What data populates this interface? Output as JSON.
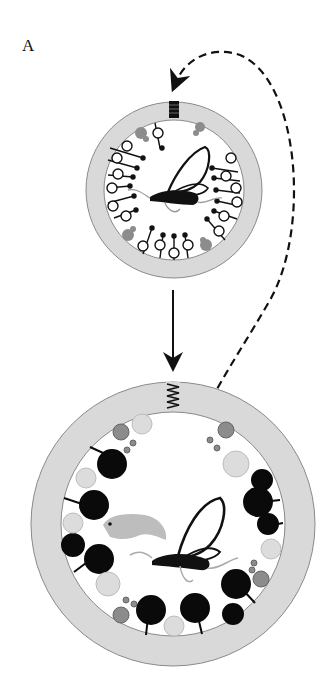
{
  "figure": {
    "panel_label": "A",
    "colors": {
      "background": "#ffffff",
      "ring": "#d9d9d9",
      "ring_stroke": "#8a8a8a",
      "black": "#0a0a0a",
      "dark_gray": "#8c8c8c",
      "light_gray": "#dcdcdc",
      "open": "#ffffff"
    },
    "top_cell": {
      "cx": 174,
      "cy": 190,
      "r_outer": 88,
      "r_inner": 70,
      "receptor": "closed-spring"
    },
    "bottom_cell": {
      "cx": 173,
      "cy": 524,
      "r_outer": 142,
      "r_inner": 112,
      "receptor": "open-spring"
    },
    "arrows": [
      {
        "type": "solid",
        "from": "top_cell",
        "to": "bottom_cell"
      },
      {
        "type": "dashed",
        "from": "bottom_cell",
        "to": "top_cell"
      }
    ],
    "organisms": [
      "wasp",
      "wasp",
      "weevil-larva"
    ]
  }
}
